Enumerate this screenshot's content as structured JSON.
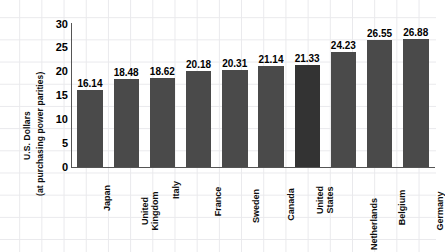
{
  "chart_data": {
    "type": "bar",
    "title": "",
    "xlabel": "",
    "ylabel_line1": "U.S. Dollars",
    "ylabel_line2": "(at purchasing power parities)",
    "categories": [
      "Japan",
      "United Kingdom",
      "Italy",
      "France",
      "Sweden",
      "Canada",
      "United States",
      "Netherlands",
      "Belgium",
      "Germany"
    ],
    "category_lines": [
      [
        "Japan"
      ],
      [
        "United",
        "Kingdom"
      ],
      [
        "Italy"
      ],
      [
        "France"
      ],
      [
        "Sweden"
      ],
      [
        "Canada"
      ],
      [
        "United",
        "States"
      ],
      [
        "Netherlands"
      ],
      [
        "Belgium"
      ],
      [
        "Germany"
      ]
    ],
    "values": [
      16.14,
      18.48,
      18.62,
      20.18,
      20.31,
      21.14,
      21.33,
      24.23,
      26.55,
      26.88
    ],
    "value_labels": [
      "16.14",
      "18.48",
      "18.62",
      "20.18",
      "20.31",
      "21.14",
      "21.33",
      "24.23",
      "26.55",
      "26.88"
    ],
    "ylim": [
      0,
      30
    ],
    "yticks": [
      0,
      5,
      10,
      15,
      20,
      25,
      30
    ],
    "ytick_labels": [
      "0",
      "5",
      "10",
      "15",
      "20",
      "25",
      "30"
    ],
    "grid": true,
    "legend": false,
    "bar_color": "#4a4a4a",
    "highlight_color": "#333333",
    "highlight_index": 6,
    "background_color": "#ffffff",
    "grid_color": "#e9e9ec"
  }
}
